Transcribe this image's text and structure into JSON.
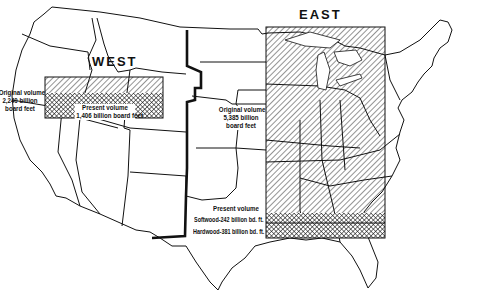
{
  "map": {
    "subject": "United States forest timber volume, original vs present",
    "regions": [
      {
        "name": "WEST",
        "original_volume_label": [
          "Original volume",
          "2,240 billion",
          "board feet"
        ],
        "present_volume_label": [
          "Present volume",
          "1,406 billion board feet"
        ]
      },
      {
        "name": "EAST",
        "original_volume_label": [
          "Original volume",
          "5,385 billion",
          "board feet"
        ],
        "present_volume_label": {
          "heading": "Present volume",
          "softwood": "Softwood-242 billion bd. ft.",
          "hardwood": "Hardwood-381 billion bd. ft."
        }
      }
    ],
    "legend_patterns": {
      "original": "diagonal-hatch",
      "present": "cross-hatch"
    },
    "colors": {
      "ink": "#111111",
      "paper": "#ffffff"
    }
  }
}
